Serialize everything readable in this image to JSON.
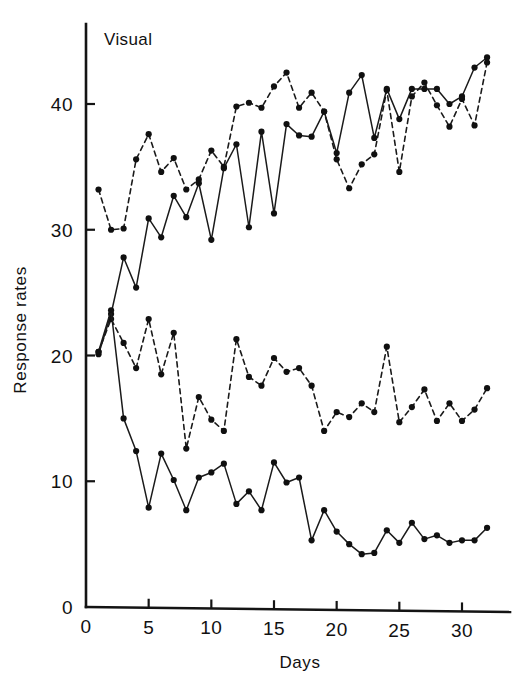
{
  "figure": {
    "panel_label": "Visual",
    "background": "#ffffff",
    "ink_color": "#111111"
  },
  "chart_data": {
    "type": "line",
    "title": "Visual",
    "xlabel": "Days",
    "ylabel": "Response rates",
    "xlim": [
      0,
      33
    ],
    "ylim": [
      0,
      45
    ],
    "xticks": [
      0,
      5,
      10,
      15,
      20,
      25,
      30
    ],
    "xticklabels": [
      "0",
      "5",
      "10",
      "15",
      "20",
      "25",
      "30"
    ],
    "yticks": [
      0,
      10,
      20,
      30,
      40
    ],
    "yticklabels": [
      "0",
      "10",
      "20",
      "30",
      "40"
    ],
    "grid": false,
    "legend": "none",
    "x": [
      1,
      2,
      3,
      4,
      5,
      6,
      7,
      8,
      9,
      10,
      11,
      12,
      13,
      14,
      15,
      16,
      17,
      18,
      19,
      20,
      21,
      22,
      23,
      24,
      25,
      26,
      27,
      28,
      29,
      30,
      31,
      32
    ],
    "series": [
      {
        "name": "upper-dashed",
        "style": "dashed",
        "values": [
          33.2,
          30.0,
          30.1,
          35.6,
          37.6,
          34.6,
          35.7,
          33.2,
          34.0,
          36.3,
          35.0,
          39.8,
          40.1,
          39.7,
          41.4,
          42.5,
          39.7,
          40.9,
          39.4,
          35.6,
          33.3,
          35.2,
          36.0,
          41.1,
          34.6,
          40.6,
          41.7,
          39.9,
          38.2,
          40.4,
          38.3,
          43.3
        ]
      },
      {
        "name": "upper-solid",
        "style": "solid",
        "values": [
          20.1,
          23.3,
          27.8,
          25.4,
          30.9,
          29.4,
          32.7,
          31.0,
          33.7,
          29.2,
          34.9,
          36.8,
          30.2,
          37.8,
          31.3,
          38.4,
          37.5,
          37.4,
          39.4,
          36.1,
          40.9,
          42.3,
          37.3,
          41.2,
          38.8,
          41.2,
          41.2,
          41.2,
          40.0,
          40.6,
          42.9,
          43.7
        ]
      },
      {
        "name": "lower-dashed",
        "style": "dashed",
        "values": [
          20.3,
          22.9,
          21.0,
          19.0,
          22.9,
          18.5,
          21.8,
          12.6,
          16.7,
          14.9,
          14.0,
          21.3,
          18.3,
          17.6,
          19.8,
          18.7,
          19.0,
          17.6,
          14.0,
          15.5,
          15.1,
          16.2,
          15.5,
          20.7,
          14.7,
          15.9,
          17.3,
          14.8,
          16.2,
          14.8,
          15.7,
          17.4
        ]
      },
      {
        "name": "lower-solid",
        "style": "solid",
        "values": [
          20.3,
          23.6,
          15.0,
          12.4,
          7.9,
          12.2,
          10.1,
          7.7,
          10.3,
          10.7,
          11.4,
          8.2,
          9.2,
          7.7,
          11.5,
          9.9,
          10.3,
          5.3,
          7.7,
          6.0,
          5.0,
          4.2,
          4.3,
          6.1,
          5.1,
          6.7,
          5.4,
          5.7,
          5.1,
          5.3,
          5.3,
          6.3
        ]
      }
    ]
  }
}
